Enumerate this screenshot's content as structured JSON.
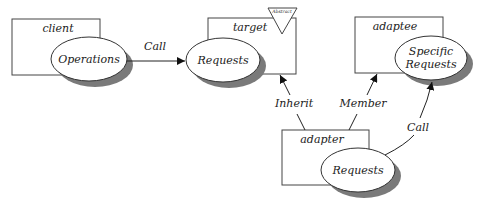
{
  "diagram": {
    "type": "adapter-pattern",
    "nodes": {
      "client": {
        "label": "client",
        "method": "Operations"
      },
      "target": {
        "label": "target",
        "method": "Requests",
        "badge": "Abstract"
      },
      "adaptee": {
        "label": "adaptee",
        "method_line1": "Specific",
        "method_line2": "Requests"
      },
      "adapter": {
        "label": "adapter",
        "method": "Requests"
      }
    },
    "edges": {
      "client_to_target": {
        "label": "Call"
      },
      "adapter_to_target": {
        "label": "Inherit"
      },
      "adapter_to_adaptee": {
        "label": "Member"
      },
      "adapter_call_adaptee": {
        "label": "Call"
      }
    },
    "colors": {
      "stroke": "#444444",
      "shadow": "#7a7a7a",
      "fill": "#ffffff"
    }
  }
}
